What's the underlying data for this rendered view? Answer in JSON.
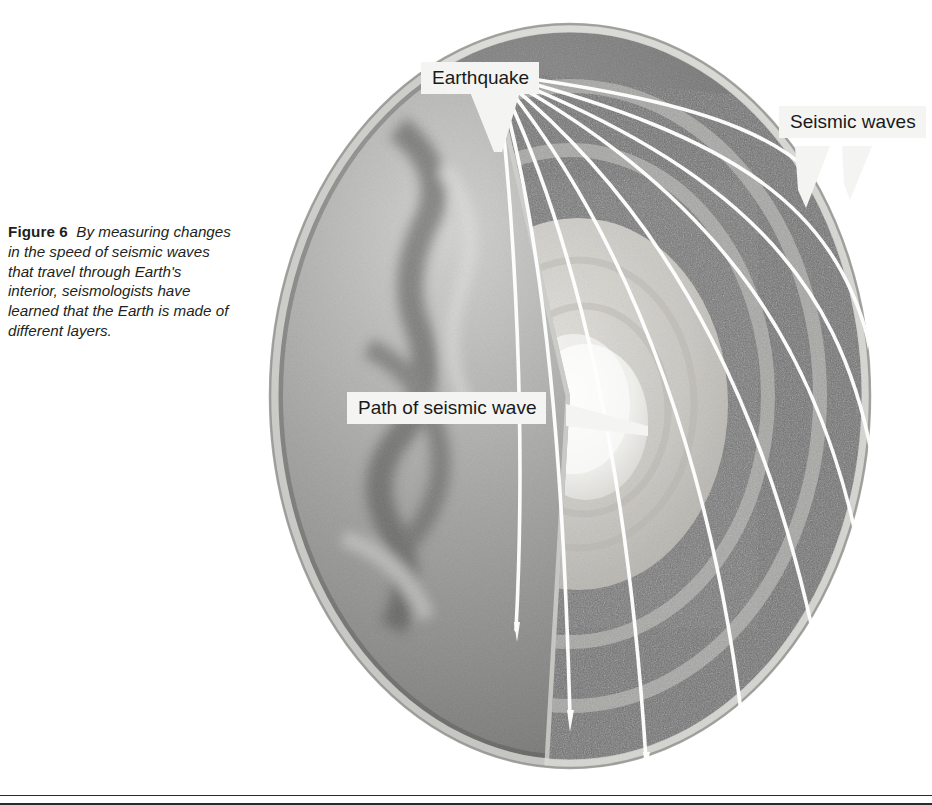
{
  "figure": {
    "label": "Figure 6",
    "caption": "By measuring changes in the speed of seismic waves that travel through Earth's interior, seismologists have learned that the Earth is made of different layers."
  },
  "labels": {
    "earthquake": "Earthquake",
    "seismic_waves": "Seismic waves",
    "path_of_seismic_wave": "Path of seismic wave"
  },
  "diagram": {
    "layers": [
      {
        "name": "crust-surface",
        "color": "#8d8d8d"
      },
      {
        "name": "mantle",
        "color": "#6f6f6f"
      },
      {
        "name": "outer-core",
        "color": "#c9c9c5"
      },
      {
        "name": "inner-core",
        "color": "#ededea"
      }
    ],
    "ray_color": "#ffffff",
    "ray_count": 9,
    "focus_label": "earthquake-focus",
    "callout_box_color": "#f4f4f2",
    "text_color": "#1a1a1a"
  }
}
